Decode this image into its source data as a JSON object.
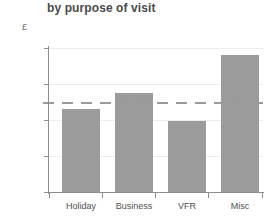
{
  "chart_data": {
    "type": "bar",
    "title": "by purpose of visit",
    "xlabel": "",
    "ylabel": "£",
    "categories": [
      "Holiday",
      "Business",
      "VFR",
      "Misc"
    ],
    "values": [
      460,
      550,
      395,
      760
    ],
    "ylim": [
      0,
      800
    ],
    "yticks": [
      0,
      200,
      400,
      600,
      800
    ],
    "ytick_labels": [
      "0",
      "200",
      "400",
      "600",
      "800"
    ],
    "grid": true,
    "legend": false,
    "bar_color": "#9b9b9b",
    "annotations": [
      {
        "name": "average-reference-line",
        "type": "horizontal-dashed-line",
        "value": 500,
        "color": "#9a9a9a"
      }
    ]
  }
}
